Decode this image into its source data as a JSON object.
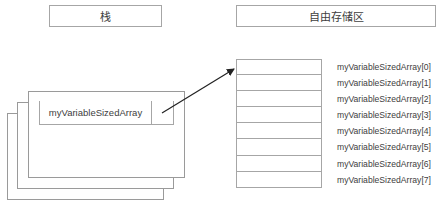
{
  "headers": {
    "stack": "栈",
    "free_store": "自由存储区"
  },
  "stack_frame": {
    "pointer_variable": "myVariableSizedArray"
  },
  "free_store_array": {
    "element_count": 8,
    "labels": [
      "myVariableSizedArray[0]",
      "myVariableSizedArray[1]",
      "myVariableSizedArray[2]",
      "myVariableSizedArray[3]",
      "myVariableSizedArray[4]",
      "myVariableSizedArray[5]",
      "myVariableSizedArray[6]",
      "myVariableSizedArray[7]"
    ]
  },
  "colors": {
    "border": "#a6a6a6",
    "text": "#404040",
    "arrow": "#222222"
  }
}
